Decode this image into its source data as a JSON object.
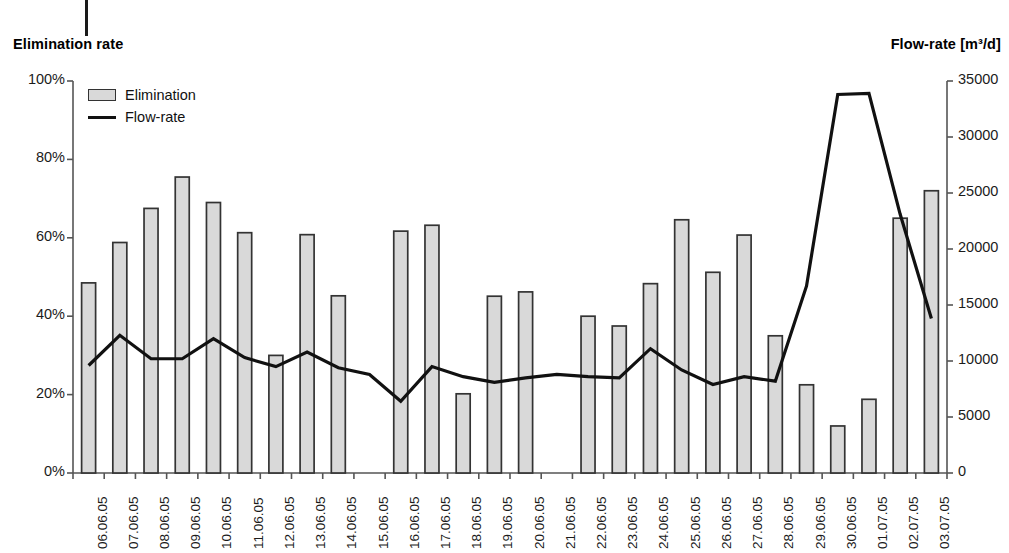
{
  "axes": {
    "left_title": "Elimination rate",
    "right_title": "Flow-rate [m³/d]",
    "left_ticks": [
      "100%",
      "80%",
      "60%",
      "40%",
      "20%",
      "0%"
    ],
    "right_ticks": [
      "35000",
      "30000",
      "25000",
      "20000",
      "15000",
      "10000",
      "5000",
      "0"
    ]
  },
  "legend": {
    "items": [
      {
        "label": "Elimination",
        "kind": "bar",
        "color": "#d9d9d9"
      },
      {
        "label": "Flow-rate",
        "kind": "line",
        "color": "#111111"
      }
    ]
  },
  "colors": {
    "bar_fill": "#d9d9d9",
    "bar_stroke": "#333333",
    "line": "#111111",
    "axis": "#555555",
    "text": "#1b1b1b"
  },
  "chart_data": {
    "type": "bar",
    "title": "",
    "subtitle": "",
    "xlabel": "",
    "ylabel": "Elimination rate",
    "y2label": "Flow-rate [m³/d]",
    "ylim": [
      0,
      100
    ],
    "y2lim": [
      0,
      35000
    ],
    "ytick_values": [
      0,
      20,
      40,
      60,
      80,
      100
    ],
    "y2tick_values": [
      0,
      5000,
      10000,
      15000,
      20000,
      25000,
      30000,
      35000
    ],
    "grid": false,
    "legend_position": "top-left",
    "categories": [
      "06.06.05",
      "07.06.05",
      "08.06.05",
      "09.06.05",
      "10.06.05",
      "11.06.05",
      "12.06.05",
      "13.06.05",
      "14.06.05",
      "15.06.05",
      "16.06.05",
      "17.06.05",
      "18.06.05",
      "19.06.05",
      "20.06.05",
      "21.06.05",
      "22.06.05",
      "23.06.05",
      "24.06.05",
      "25.06.05",
      "26.06.05",
      "27.06.05",
      "28.06.05",
      "29.06.05",
      "30.06.05",
      "01.07.05",
      "02.07.05",
      "03.07.05"
    ],
    "series": [
      {
        "name": "Elimination",
        "type": "bar",
        "unit": "%",
        "axis": "left",
        "values": [
          48.5,
          58.8,
          67.5,
          75.5,
          69.0,
          61.3,
          30.0,
          60.8,
          45.2,
          null,
          61.7,
          63.2,
          20.2,
          45.1,
          46.2,
          null,
          40.0,
          37.5,
          48.3,
          64.6,
          51.2,
          60.7,
          35.0,
          22.5,
          12.0,
          18.8,
          65.0,
          72.0
        ]
      },
      {
        "name": "Flow-rate",
        "type": "line",
        "unit": "m³/d",
        "axis": "right",
        "values": [
          9600,
          12300,
          10200,
          10200,
          12000,
          10300,
          9500,
          10800,
          9400,
          8800,
          6400,
          9500,
          8600,
          8100,
          8500,
          8800,
          8600,
          8500,
          11100,
          9200,
          7900,
          8600,
          8200,
          16700,
          33800,
          33900,
          23100,
          13800
        ]
      }
    ]
  }
}
